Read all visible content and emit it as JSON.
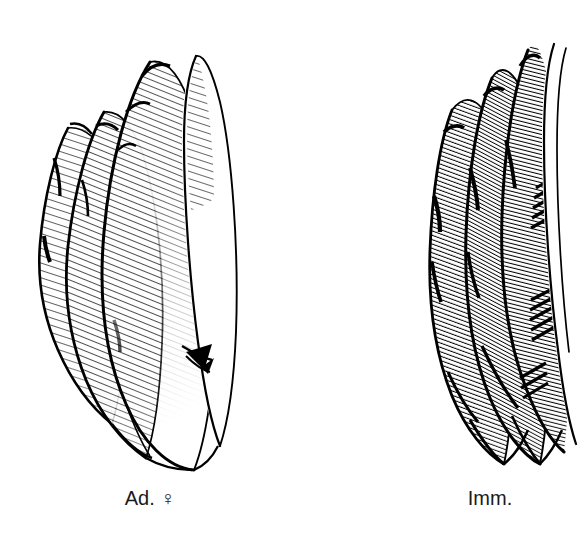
{
  "figure": {
    "panel_label": "A",
    "background_color": "#ffffff",
    "ink_color": "#000000",
    "medium": "pen-and-ink line drawing"
  },
  "groups": [
    {
      "id": "left-group",
      "caption": "Ad. ♀",
      "caption_plain": "Ad. female",
      "name": "adult-female-feather-group",
      "feather_count": 4,
      "shading": "fine oblique hatching, pale, with large unhatched white tips",
      "hatch_angle_deg": 72,
      "hatch_density": "sparse",
      "bbox": {
        "x": 35,
        "y": 48,
        "width": 190,
        "height": 415
      }
    },
    {
      "id": "right-group",
      "caption": "Imm.",
      "caption_plain": "Immature",
      "name": "immature-feather-group",
      "feather_count": 4,
      "shading": "dense coarse oblique hatching with heavy blotches throughout",
      "hatch_angle_deg": 70,
      "hatch_density": "dense",
      "bbox": {
        "x": 428,
        "y": 45,
        "width": 135,
        "height": 420
      }
    }
  ],
  "captions": {
    "left": "Ad. ♀",
    "right": "Imm."
  },
  "icons": {
    "female_symbol": "female-symbol-glyph"
  }
}
